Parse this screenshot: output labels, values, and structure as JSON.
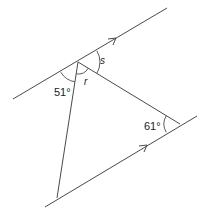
{
  "diagram": {
    "type": "geometry-parallel-lines-triangle",
    "labels": {
      "angle_bottom_left_of_top_vertex": "51°",
      "angle_at_right_vertex": "61°",
      "angle_s": "s",
      "angle_r": "r"
    },
    "parallel_lines": [
      {
        "name": "upper-parallel-line",
        "arrow": true
      },
      {
        "name": "lower-parallel-line",
        "arrow": true
      }
    ],
    "colors": {
      "stroke": "#4a4a4a",
      "text": "#222222",
      "background": "#ffffff"
    }
  }
}
